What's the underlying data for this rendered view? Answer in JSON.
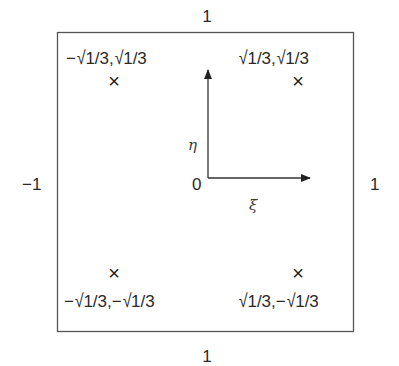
{
  "diagram": {
    "title": "",
    "element_domain": {
      "edges": {
        "top": "1",
        "bottom": "1",
        "left": "−1",
        "right": "1"
      }
    },
    "axes": {
      "origin_label": "0",
      "xi_label": "ξ",
      "eta_label": "η"
    },
    "gauss_points": [
      {
        "id": "top-left",
        "label_parts": [
          "−",
          "√",
          "1/3,",
          "√",
          "1/3"
        ],
        "label": "−√1/3,√1/3",
        "xi": -0.57735,
        "eta": 0.57735,
        "marker": "×"
      },
      {
        "id": "top-right",
        "label_parts": [
          "",
          "√",
          "1/3,",
          "√",
          "1/3"
        ],
        "label": "√1/3,√1/3",
        "xi": 0.57735,
        "eta": 0.57735,
        "marker": "×"
      },
      {
        "id": "bottom-left",
        "label_parts": [
          "−",
          "√",
          "1/3,−",
          "√",
          "1/3"
        ],
        "label": "−√1/3,−√1/3",
        "xi": -0.57735,
        "eta": -0.57735,
        "marker": "×"
      },
      {
        "id": "bottom-right",
        "label_parts": [
          "",
          "√",
          "1/3,−",
          "√",
          "1/3"
        ],
        "label": "√1/3,−√1/3",
        "xi": 0.57735,
        "eta": -0.57735,
        "marker": "×"
      }
    ],
    "colors": {
      "line": "#555555",
      "text": "#2a2a2a",
      "background": "#ffffff"
    }
  }
}
